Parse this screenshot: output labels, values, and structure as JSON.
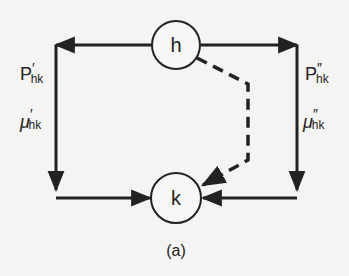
{
  "diagram": {
    "caption": "(a)",
    "nodes": [
      {
        "id": "h",
        "label": "h"
      },
      {
        "id": "k",
        "label": "k"
      }
    ],
    "edges": [
      {
        "from": "h",
        "to": "k",
        "path": "left",
        "style": "solid",
        "labels": {
          "top": {
            "base": "P",
            "prime": "′",
            "sub": "hk"
          },
          "bottom": {
            "base": "μ",
            "prime": "′",
            "sub": "hk"
          }
        }
      },
      {
        "from": "h",
        "to": "k",
        "path": "right",
        "style": "solid",
        "labels": {
          "top": {
            "base": "P",
            "prime": "″",
            "sub": "hk"
          },
          "bottom": {
            "base": "μ",
            "prime": "″",
            "sub": "hk"
          }
        }
      },
      {
        "from": "h",
        "to": "k",
        "path": "middle",
        "style": "dashed"
      }
    ]
  }
}
